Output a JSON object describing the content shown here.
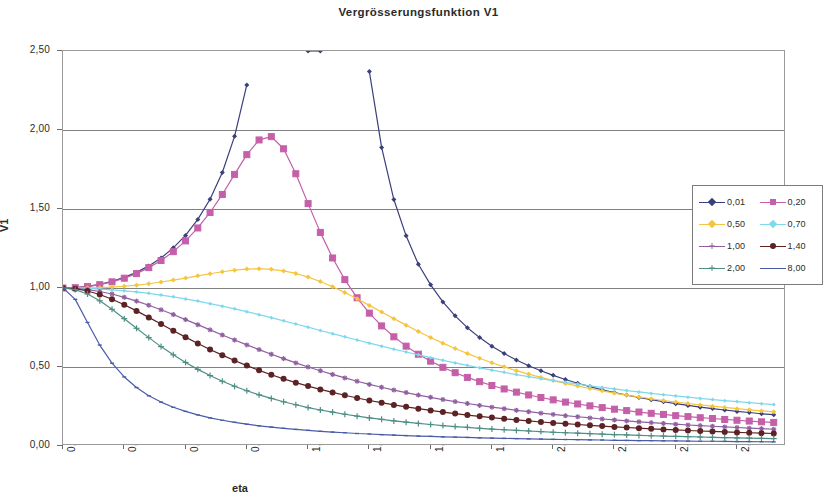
{
  "chart_data": {
    "type": "line",
    "title": "Vergrösserungsfunktion V1",
    "xlabel": "eta",
    "ylabel": "V1",
    "xlim": [
      0.0,
      2.95
    ],
    "ylim": [
      0.0,
      2.5
    ],
    "xticks": [
      "0,00",
      "0,25",
      "0,50",
      "0,75",
      "1,00",
      "1,25",
      "1,50",
      "1,75",
      "2,00",
      "2,25",
      "2,50",
      "2,75"
    ],
    "xtick_values": [
      0.0,
      0.25,
      0.5,
      0.75,
      1.0,
      1.25,
      1.5,
      1.75,
      2.0,
      2.25,
      2.5,
      2.75
    ],
    "yticks": [
      "0,00",
      "0,50",
      "1,00",
      "1,50",
      "2,00",
      "2,50"
    ],
    "ytick_values": [
      0.0,
      0.5,
      1.0,
      1.5,
      2.0,
      2.5
    ],
    "grid": "horizontal",
    "legend_position": "right-middle",
    "x": [
      0.0,
      0.05,
      0.1,
      0.15,
      0.2,
      0.25,
      0.3,
      0.35,
      0.4,
      0.45,
      0.5,
      0.55,
      0.6,
      0.65,
      0.7,
      0.75,
      0.8,
      0.85,
      0.9,
      0.95,
      1.0,
      1.05,
      1.1,
      1.15,
      1.2,
      1.25,
      1.3,
      1.35,
      1.4,
      1.45,
      1.5,
      1.55,
      1.6,
      1.65,
      1.7,
      1.75,
      1.8,
      1.85,
      1.9,
      1.95,
      2.0,
      2.05,
      2.1,
      2.15,
      2.2,
      2.25,
      2.3,
      2.35,
      2.4,
      2.45,
      2.5,
      2.55,
      2.6,
      2.65,
      2.7,
      2.75,
      2.8,
      2.85,
      2.9
    ],
    "series": [
      {
        "name": "0,01",
        "damping": 0.01,
        "color": "#3b3f7a",
        "marker": "diamond",
        "marker_size": 5,
        "clipped_above": 2.5,
        "values": [
          1.0,
          1.003,
          1.01,
          1.023,
          1.042,
          1.067,
          1.099,
          1.14,
          1.19,
          1.254,
          1.333,
          1.434,
          1.562,
          1.731,
          1.96,
          2.285,
          2.777,
          3.595,
          5.24,
          10.11,
          2.5,
          2.5,
          9.33,
          4.71,
          3.17,
          2.37,
          1.89,
          1.56,
          1.33,
          1.15,
          1.02,
          0.912,
          0.824,
          0.749,
          0.686,
          0.632,
          0.585,
          0.544,
          0.508,
          0.476,
          0.447,
          0.421,
          0.397,
          0.376,
          0.356,
          0.338,
          0.322,
          0.307,
          0.293,
          0.28,
          0.268,
          0.257,
          0.246,
          0.237,
          0.228,
          0.219,
          0.212,
          0.204,
          0.198
        ]
      },
      {
        "name": "0,20",
        "damping": 0.2,
        "color": "#c45fa8",
        "marker": "square",
        "marker_size": 6,
        "clipped_above": 2.5,
        "values": [
          1.0,
          1.002,
          1.009,
          1.021,
          1.039,
          1.062,
          1.091,
          1.129,
          1.174,
          1.23,
          1.298,
          1.38,
          1.478,
          1.592,
          1.719,
          1.844,
          1.937,
          1.958,
          1.881,
          1.723,
          1.534,
          1.352,
          1.19,
          1.053,
          0.938,
          0.841,
          0.76,
          0.691,
          0.632,
          0.581,
          0.537,
          0.498,
          0.464,
          0.434,
          0.407,
          0.383,
          0.361,
          0.341,
          0.323,
          0.307,
          0.292,
          0.278,
          0.266,
          0.254,
          0.243,
          0.233,
          0.224,
          0.215,
          0.207,
          0.2,
          0.192,
          0.186,
          0.179,
          0.174,
          0.168,
          0.163,
          0.158,
          0.153,
          0.149
        ]
      },
      {
        "name": "0,50",
        "damping": 0.5,
        "color": "#f5c53d",
        "marker": "diamond",
        "marker_size": 5,
        "values": [
          1.0,
          1.0,
          1.0,
          1.002,
          1.006,
          1.011,
          1.018,
          1.027,
          1.038,
          1.05,
          1.063,
          1.077,
          1.09,
          1.103,
          1.113,
          1.12,
          1.122,
          1.118,
          1.108,
          1.092,
          1.069,
          1.041,
          1.008,
          0.971,
          0.932,
          0.89,
          0.848,
          0.806,
          0.765,
          0.725,
          0.687,
          0.651,
          0.617,
          0.585,
          0.555,
          0.527,
          0.501,
          0.477,
          0.455,
          0.434,
          0.414,
          0.396,
          0.379,
          0.364,
          0.349,
          0.335,
          0.322,
          0.31,
          0.299,
          0.288,
          0.278,
          0.269,
          0.26,
          0.252,
          0.244,
          0.236,
          0.229,
          0.222,
          0.216
        ]
      },
      {
        "name": "0,70",
        "damping": 0.7,
        "color": "#7fd8ec",
        "marker": "diamond",
        "marker_size": 4,
        "values": [
          1.0,
          0.999,
          0.997,
          0.993,
          0.988,
          0.982,
          0.975,
          0.966,
          0.955,
          0.944,
          0.931,
          0.917,
          0.901,
          0.885,
          0.868,
          0.85,
          0.831,
          0.812,
          0.792,
          0.772,
          0.752,
          0.731,
          0.711,
          0.691,
          0.671,
          0.651,
          0.632,
          0.613,
          0.595,
          0.577,
          0.559,
          0.542,
          0.526,
          0.51,
          0.495,
          0.48,
          0.466,
          0.452,
          0.439,
          0.426,
          0.414,
          0.403,
          0.392,
          0.381,
          0.371,
          0.361,
          0.351,
          0.342,
          0.333,
          0.325,
          0.317,
          0.309,
          0.301,
          0.294,
          0.287,
          0.281,
          0.274,
          0.268,
          0.262
        ]
      },
      {
        "name": "1,00",
        "damping": 1.0,
        "color": "#8f5fa0",
        "marker": "star",
        "marker_size": 5,
        "values": [
          1.0,
          0.998,
          0.99,
          0.978,
          0.962,
          0.941,
          0.917,
          0.891,
          0.862,
          0.832,
          0.8,
          0.768,
          0.735,
          0.703,
          0.671,
          0.64,
          0.61,
          0.581,
          0.553,
          0.526,
          0.5,
          0.476,
          0.453,
          0.431,
          0.41,
          0.39,
          0.372,
          0.354,
          0.338,
          0.322,
          0.308,
          0.294,
          0.281,
          0.269,
          0.257,
          0.246,
          0.236,
          0.226,
          0.217,
          0.208,
          0.2,
          0.192,
          0.185,
          0.178,
          0.171,
          0.165,
          0.159,
          0.153,
          0.148,
          0.143,
          0.138,
          0.133,
          0.129,
          0.125,
          0.121,
          0.117,
          0.113,
          0.11,
          0.106
        ]
      },
      {
        "name": "1,40",
        "damping": 1.4,
        "color": "#5c2224",
        "marker": "circle",
        "marker_size": 6,
        "values": [
          1.0,
          0.996,
          0.981,
          0.959,
          0.929,
          0.894,
          0.855,
          0.814,
          0.772,
          0.73,
          0.689,
          0.649,
          0.611,
          0.575,
          0.541,
          0.509,
          0.479,
          0.451,
          0.425,
          0.401,
          0.379,
          0.358,
          0.339,
          0.321,
          0.304,
          0.288,
          0.274,
          0.26,
          0.248,
          0.236,
          0.225,
          0.215,
          0.205,
          0.196,
          0.188,
          0.18,
          0.172,
          0.165,
          0.159,
          0.152,
          0.146,
          0.141,
          0.136,
          0.131,
          0.126,
          0.121,
          0.117,
          0.113,
          0.109,
          0.105,
          0.102,
          0.098,
          0.095,
          0.092,
          0.089,
          0.086,
          0.084,
          0.081,
          0.079
        ]
      },
      {
        "name": "2,00",
        "damping": 2.0,
        "color": "#4e8f84",
        "marker": "plus",
        "marker_size": 6,
        "values": [
          1.0,
          0.99,
          0.962,
          0.919,
          0.865,
          0.806,
          0.745,
          0.686,
          0.629,
          0.577,
          0.529,
          0.485,
          0.446,
          0.41,
          0.378,
          0.35,
          0.324,
          0.301,
          0.28,
          0.261,
          0.243,
          0.228,
          0.214,
          0.201,
          0.189,
          0.178,
          0.169,
          0.159,
          0.151,
          0.143,
          0.136,
          0.129,
          0.123,
          0.118,
          0.112,
          0.107,
          0.103,
          0.099,
          0.095,
          0.091,
          0.087,
          0.084,
          0.081,
          0.078,
          0.075,
          0.072,
          0.07,
          0.067,
          0.065,
          0.063,
          0.061,
          0.059,
          0.057,
          0.055,
          0.053,
          0.051,
          0.05,
          0.048,
          0.047
        ]
      },
      {
        "name": "8,00",
        "damping": 8.0,
        "color": "#4a5ca8",
        "marker": "tick",
        "marker_size": 4,
        "values": [
          1.0,
          0.928,
          0.782,
          0.639,
          0.524,
          0.437,
          0.37,
          0.318,
          0.278,
          0.245,
          0.219,
          0.197,
          0.178,
          0.163,
          0.15,
          0.138,
          0.128,
          0.12,
          0.112,
          0.105,
          0.099,
          0.093,
          0.088,
          0.084,
          0.079,
          0.076,
          0.072,
          0.069,
          0.066,
          0.063,
          0.061,
          0.058,
          0.056,
          0.054,
          0.052,
          0.05,
          0.048,
          0.047,
          0.045,
          0.044,
          0.042,
          0.041,
          0.04,
          0.039,
          0.038,
          0.036,
          0.035,
          0.034,
          0.034,
          0.033,
          0.032,
          0.031,
          0.03,
          0.03,
          0.029,
          0.028,
          0.028,
          0.027,
          0.026
        ]
      }
    ]
  },
  "legend": {
    "items": [
      {
        "label": "0,01"
      },
      {
        "label": "0,20"
      },
      {
        "label": "0,50"
      },
      {
        "label": "0,70"
      },
      {
        "label": "1,00"
      },
      {
        "label": "1,40"
      },
      {
        "label": "2,00"
      },
      {
        "label": "8,00"
      }
    ]
  }
}
